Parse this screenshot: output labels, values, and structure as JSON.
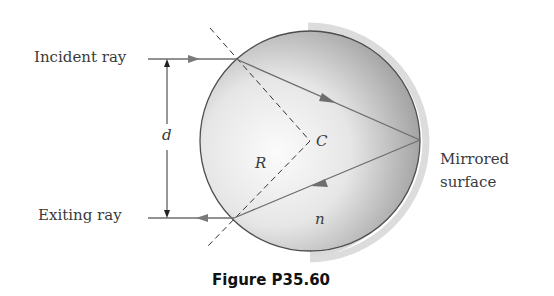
{
  "labels": {
    "incident_ray": "Incident ray",
    "exiting_ray": "Exiting ray",
    "distance": "d",
    "center": "C",
    "radius": "R",
    "index": "n",
    "mirror_line1": "Mirrored",
    "mirror_line2": "surface"
  },
  "caption": "Figure P35.60",
  "geometry": {
    "sphere_center": [
      310,
      141
    ],
    "sphere_radius": 110,
    "incident_ray_y": 59,
    "exiting_ray_y": 218,
    "entry_point": [
      236,
      59
    ],
    "exit_point": [
      234,
      218
    ],
    "reflection_point": [
      420,
      140
    ]
  },
  "colors": {
    "ray": "#6e6e6e",
    "outline": "#4a4a4a",
    "mirror": "#d6d6d6",
    "sphere_light": "#f4f4f4",
    "sphere_dark": "#9c9c9c"
  }
}
